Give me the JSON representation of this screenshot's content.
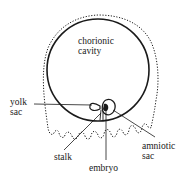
{
  "diagram": {
    "type": "anatomical-illustration",
    "colors": {
      "line": "#1a1a1a",
      "background": "#ffffff"
    },
    "labels": {
      "chorionic_cavity": [
        "chorionic",
        "cavity"
      ],
      "yolk_sac": [
        "yolk",
        "sac"
      ],
      "stalk": [
        "stalk"
      ],
      "embryo": [
        "embryo"
      ],
      "amniotic_sac": [
        "amniotic",
        "sac"
      ]
    }
  }
}
